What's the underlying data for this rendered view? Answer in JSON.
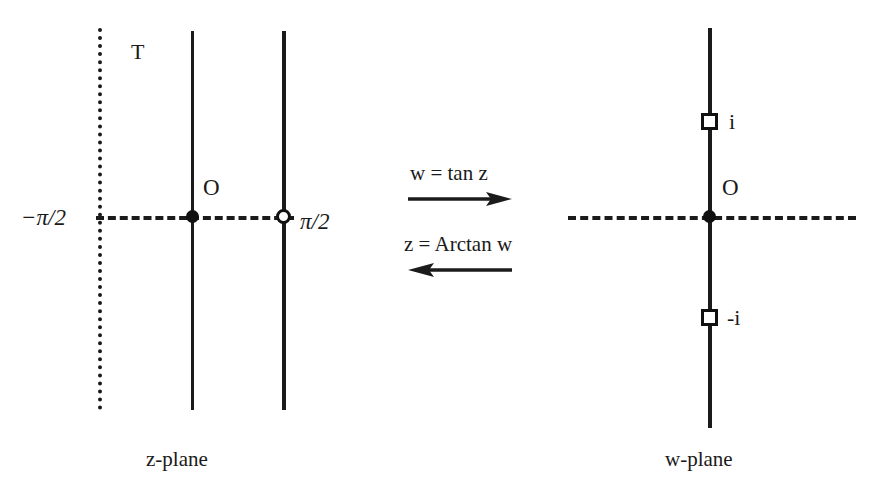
{
  "figure": {
    "background_color": "#ffffff",
    "ink_color": "#1b1b1b"
  },
  "z_plane": {
    "caption": "z-plane",
    "region_label": "T",
    "origin_label": "O",
    "left_boundary_label": "−π/2",
    "right_boundary_label": "π/2",
    "left_boundary_style": "dotted",
    "middle_line_style": "solid",
    "right_boundary_style": "solid",
    "real_axis_style": "dashed",
    "origin_marker": "filled-dot",
    "right_axis_marker": "open-dot"
  },
  "w_plane": {
    "caption": "w-plane",
    "origin_label": "O",
    "upper_marker_label": "i",
    "lower_marker_label": "-i",
    "imaginary_axis_style": "solid",
    "real_axis_style": "dashed",
    "origin_marker": "filled-dot",
    "upper_marker": "open-square",
    "lower_marker": "open-square"
  },
  "mapping": {
    "forward_label": "w = tan z",
    "forward_direction": "right",
    "inverse_label": "z = Arctan w",
    "inverse_direction": "left"
  }
}
